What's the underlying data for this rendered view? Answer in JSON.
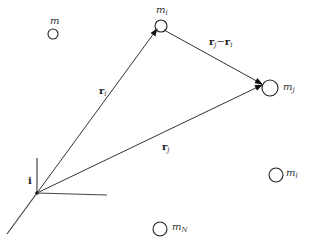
{
  "diagram": {
    "masses": [
      {
        "id": "m",
        "label": "m",
        "subscript": ""
      },
      {
        "id": "m_i",
        "label": "m",
        "subscript": "i"
      },
      {
        "id": "m_j",
        "label": "m",
        "subscript": "j"
      },
      {
        "id": "m_l",
        "label": "m",
        "subscript": "l"
      },
      {
        "id": "m_N",
        "label": "m",
        "subscript": "N"
      }
    ],
    "vectors": [
      {
        "id": "r_i",
        "label": "r",
        "subscript": "i",
        "from": "origin",
        "to": "m_i"
      },
      {
        "id": "r_j",
        "label": "r",
        "subscript": "j",
        "from": "origin",
        "to": "m_j"
      },
      {
        "id": "r_ji",
        "label": "r",
        "subscript": "j",
        "label2": "r",
        "subscript2": "i",
        "operator": "−",
        "from": "m_i",
        "to": "m_j"
      }
    ],
    "axes": {
      "unit_vector_label": "i"
    }
  }
}
